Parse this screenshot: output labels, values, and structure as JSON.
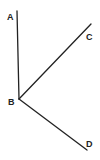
{
  "diagram": {
    "type": "geometry-rays",
    "colors": {
      "line": "#222222",
      "label": "#222222",
      "background": "#ffffff"
    },
    "points": [
      {
        "id": "A",
        "label": "A",
        "x": 17,
        "y": 11,
        "label_x": 7,
        "label_y": 20
      },
      {
        "id": "B",
        "label": "B",
        "x": 19,
        "y": 99,
        "label_x": 8,
        "label_y": 105
      },
      {
        "id": "C",
        "label": "C",
        "x": 91,
        "y": 24,
        "label_x": 86,
        "label_y": 40
      },
      {
        "id": "D",
        "label": "D",
        "x": 87,
        "y": 150,
        "label_x": 86,
        "label_y": 147
      }
    ],
    "segments": [
      {
        "from": "B",
        "to": "A"
      },
      {
        "from": "B",
        "to": "C"
      },
      {
        "from": "B",
        "to": "D"
      }
    ]
  }
}
